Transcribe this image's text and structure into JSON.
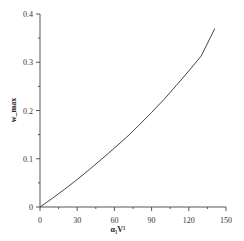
{
  "chart_data": {
    "type": "line",
    "title": "",
    "xlabel": "α₁V¹",
    "ylabel": "w_max",
    "xlim": [
      0,
      150
    ],
    "ylim": [
      0,
      0.4
    ],
    "x_ticks": [
      "0",
      "30",
      "60",
      "90",
      "120",
      "150"
    ],
    "y_ticks": [
      "0",
      "0.1",
      "0.2",
      "0.3",
      "0.4"
    ],
    "grid": false,
    "legend": null,
    "series": [
      {
        "name": "w_max",
        "x": [
          0,
          10,
          20,
          30,
          40,
          50,
          60,
          70,
          80,
          90,
          100,
          110,
          120,
          130,
          141
        ],
        "values": [
          0,
          0.018,
          0.037,
          0.057,
          0.078,
          0.1,
          0.122,
          0.145,
          0.17,
          0.196,
          0.223,
          0.252,
          0.282,
          0.313,
          0.37
        ]
      }
    ]
  }
}
